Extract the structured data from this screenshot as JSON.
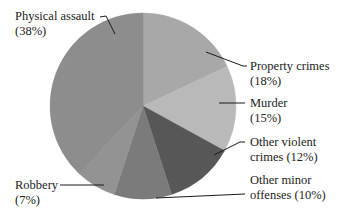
{
  "chart_data": {
    "type": "pie",
    "title": "",
    "start_angle_deg": 0,
    "direction": "clockwise",
    "slices": [
      {
        "label": "Property crimes",
        "value": 18,
        "display": "(18%)",
        "color": "#a8a8a8"
      },
      {
        "label": "Murder",
        "value": 15,
        "display": "(15%)",
        "color": "#b9b9b9"
      },
      {
        "label": "Other violent crimes",
        "value": 12,
        "display": "(12%)",
        "color": "#575757"
      },
      {
        "label": "Other minor offenses",
        "value": 10,
        "display": "(10%)",
        "color": "#7b7b7b"
      },
      {
        "label": "Robbery",
        "value": 7,
        "display": "(7%)",
        "color": "#939393"
      },
      {
        "label": "Physical assault",
        "value": 38,
        "display": "(38%)",
        "color": "#8d8d8d"
      }
    ],
    "legend": "none (callout labels with leader lines)"
  },
  "labels": {
    "physical_assault": {
      "line1": "Physical assault",
      "line2": "(38%)"
    },
    "property_crimes": {
      "line1": "Property crimes",
      "line2": "(18%)"
    },
    "murder": {
      "line1": "Murder",
      "line2": "(15%)"
    },
    "other_violent": {
      "line1": "Other violent",
      "line2": "crimes (12%)"
    },
    "other_minor": {
      "line1": "Other minor",
      "line2": "offenses (10%)"
    },
    "robbery": {
      "line1": "Robbery",
      "line2": "(7%)"
    }
  }
}
